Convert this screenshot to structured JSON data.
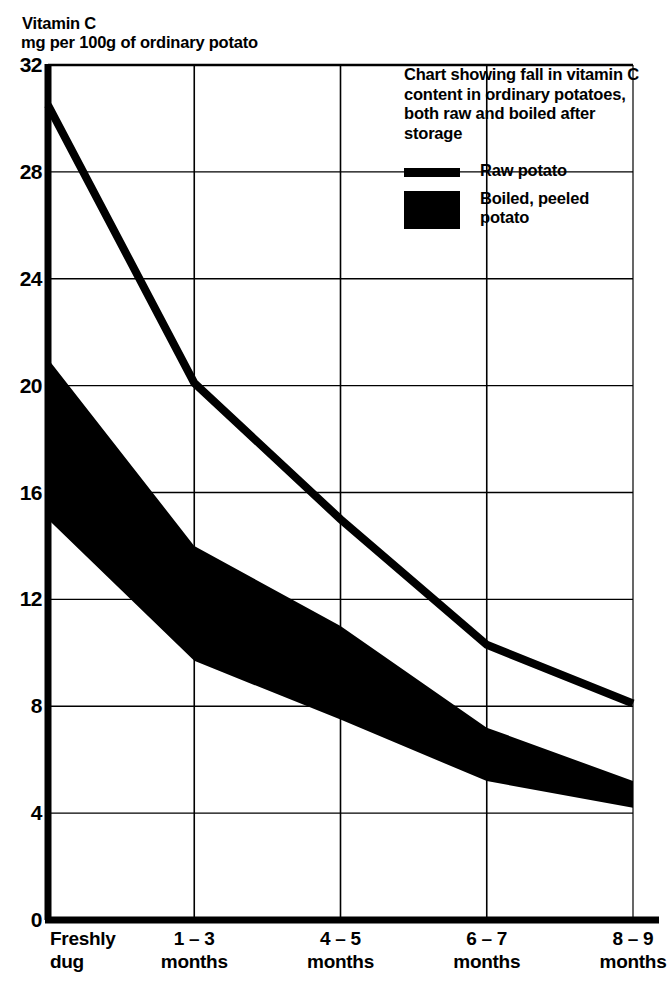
{
  "header": {
    "title_line1": "Vitamin C",
    "title_line2": "mg per 100g of ordinary potato"
  },
  "legend": {
    "description": "Chart showing fall in\nvitamin C content\nin ordinary potatoes,\nboth raw and boiled\nafter storage",
    "entries": [
      {
        "label": "Raw potato",
        "swatch": "line-swatch",
        "color": "#000000"
      },
      {
        "label": "Boiled, peeled\npotato",
        "swatch": "area-swatch",
        "color": "#000000"
      }
    ]
  },
  "axes": {
    "y_ticks": [
      "0",
      "4",
      "8",
      "12",
      "16",
      "20",
      "24",
      "28",
      "32"
    ],
    "x_ticks": [
      "Freshly\ndug",
      "1 – 3\nmonths",
      "4 – 5\nmonths",
      "6 – 7\nmonths",
      "8 – 9\nmonths"
    ]
  },
  "chart_data": {
    "type": "line",
    "title": "Chart showing fall in vitamin C content in ordinary potatoes, both raw and boiled after storage",
    "xlabel": "",
    "ylabel": "Vitamin C mg per 100g of ordinary potato",
    "categories": [
      "Freshly dug",
      "1 – 3 months",
      "4 – 5 months",
      "6 – 7 months",
      "8 – 9 months"
    ],
    "ylim": [
      0,
      32
    ],
    "ytick_step": 4,
    "grid": true,
    "legend_position": "top-right",
    "series": [
      {
        "name": "Raw potato",
        "type": "line",
        "color": "#000000",
        "values": [
          30.5,
          20.1,
          15.0,
          10.3,
          8.1
        ]
      },
      {
        "name": "Boiled, peeled potato",
        "type": "band",
        "color": "#000000",
        "upper": [
          21.0,
          14.0,
          11.0,
          7.2,
          5.2
        ],
        "lower": [
          15.0,
          9.7,
          7.5,
          5.2,
          4.2
        ]
      }
    ]
  }
}
